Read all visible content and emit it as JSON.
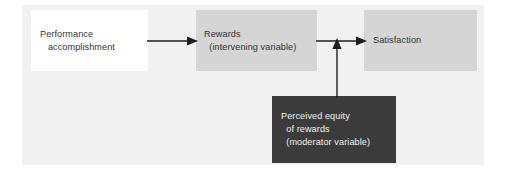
{
  "figure": {
    "background_color": "#f1f1f1",
    "page_color": "#ffffff",
    "text_color": "#333333",
    "inverse_text_color": "#f2f2f2",
    "arrow_color": "#1d1d1d"
  },
  "nodes": {
    "performance": {
      "label_line1": "Performance",
      "label_line2": "   accomplishment",
      "fill_color": "#ffffff",
      "role": "independent variable"
    },
    "rewards": {
      "label_line1": "Rewards",
      "label_line2": "  (intervening variable)",
      "fill_color": "#d5d5d5",
      "role": "intervening variable"
    },
    "satisfaction": {
      "label_line1": "Satisfaction",
      "fill_color": "#d5d5d5",
      "role": "dependent variable"
    },
    "equity": {
      "label_line1": "Perceived equity",
      "label_line2": "  of rewards",
      "label_line3": "  (moderator variable)",
      "fill_color": "#3b3b3b",
      "role": "moderator variable"
    }
  },
  "connectors": {
    "performance_to_rewards": {
      "name": "arrow-performance-to-rewards",
      "direction": "right"
    },
    "rewards_to_satisfaction": {
      "name": "arrow-rewards-to-satisfaction",
      "direction": "right"
    },
    "equity_to_link": {
      "name": "arrow-equity-to-rewards-satisfaction-link",
      "direction": "up"
    }
  }
}
